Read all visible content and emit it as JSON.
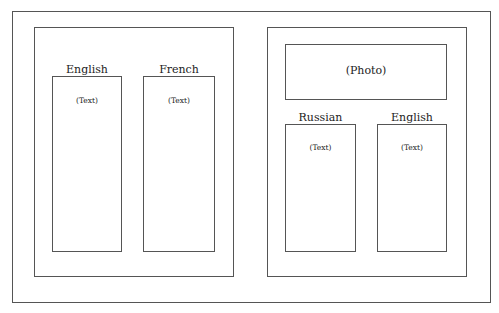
{
  "diagram": {
    "type": "page-layout-sketch",
    "left_panel": {
      "columns": [
        {
          "heading": "English",
          "content": "(Text)"
        },
        {
          "heading": "French",
          "content": "(Text)"
        }
      ]
    },
    "right_panel": {
      "photo": "(Photo)",
      "columns": [
        {
          "heading": "Russian",
          "content": "(Text)"
        },
        {
          "heading": "English",
          "content": "(Text)"
        }
      ]
    }
  }
}
